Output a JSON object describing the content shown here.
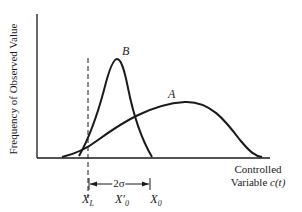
{
  "diagram": {
    "y_axis_label": "Frequency of Observed Value",
    "x_axis_label_line1": "Controlled",
    "x_axis_label_line2": "Variable",
    "x_axis_label_var": "c(t)",
    "curves": [
      {
        "label": "A",
        "description": "wide distribution, mean X0"
      },
      {
        "label": "B",
        "description": "narrow distribution, mean X'0"
      }
    ],
    "limit_line_label": "X",
    "limit_line_sub": "L",
    "mean_b_label": "X′",
    "mean_b_sub": "0",
    "mean_a_label": "X",
    "mean_a_sub": "0",
    "dimension_label": "2σ",
    "colors": {
      "ink": "#1a1a1a",
      "background": "#ffffff"
    }
  }
}
